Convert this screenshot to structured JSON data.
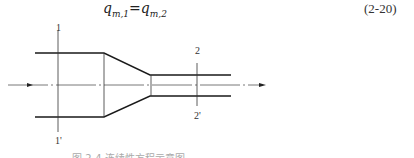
{
  "equation": {
    "lhs_base": "q",
    "lhs_sub": "m,1",
    "equals": "=",
    "rhs_base": "q",
    "rhs_sub": "m,2",
    "number": "(2-20)"
  },
  "diagram": {
    "type": "pipe-contraction",
    "section_labels": {
      "s1_top": "1",
      "s1_bottom": "1'",
      "s2_top": "2",
      "s2_bottom": "2'"
    },
    "flow_direction": "left-to-right",
    "colors": {
      "line": "#1a1a1a",
      "centerline": "#555555"
    }
  },
  "caption": {
    "text": "图 2-4   连续性方程示意图"
  }
}
